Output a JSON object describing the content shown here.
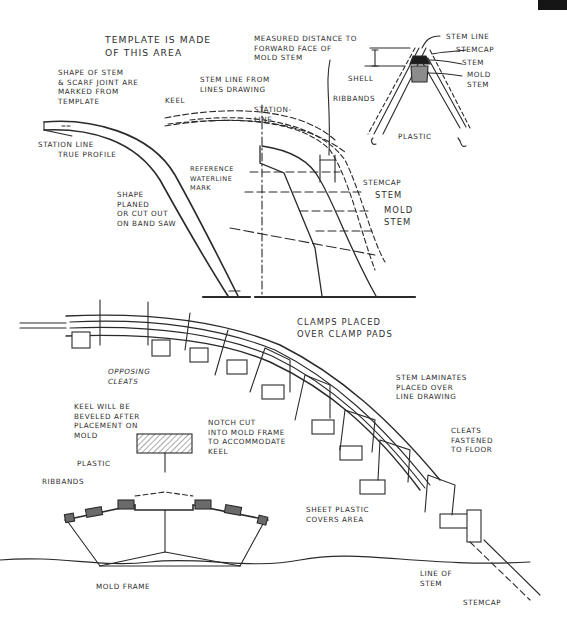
{
  "page_tab": {
    "color": "#151515"
  },
  "top_left": {
    "template_area": "TEMPLATE IS MADE\nOF THIS AREA",
    "shape_marked": "SHAPE OF STEM\n& SCARF JOINT ARE\nMARKED FROM\nTEMPLATE",
    "station_line": "STATION LINE",
    "true_profile": "TRUE PROFILE",
    "keel": "KEEL",
    "stem_line_from": "STEM LINE FROM\nLINES DRAWING",
    "shape_planed": "SHAPE\nPLANED\nOR CUT OUT\nON BAND SAW",
    "reference_waterline": "REFERENCE\nWATERLINE\nMARK"
  },
  "top_middle": {
    "measured_distance": "MEASURED DISTANCE TO\nFORWARD FACE OF\nMOLD STEM",
    "station_line": "STATION-\nLINE",
    "stemcap": "STEMCAP",
    "stem": "STEM",
    "mold_stem": "MOLD\nSTEM"
  },
  "top_right": {
    "stem_line": "STEM LINE",
    "stemcap": "STEMCAP",
    "stem": "STEM",
    "mold_stem": "MOLD\nSTEM",
    "shell": "SHELL",
    "ribbands": "RIBBANDS",
    "plastic": "PLASTIC"
  },
  "bottom": {
    "clamps": "CLAMPS PLACED\nOVER CLAMP PADS",
    "opposing_cleats": "OPPOSING\nCLEATS",
    "stem_laminates": "STEM LAMINATES\nPLACED OVER\nLINE DRAWING",
    "keel_beveled": "KEEL WILL BE\nBEVELED AFTER\nPLACEMENT ON\nMOLD",
    "notch_cut": "NOTCH CUT\nINTO MOLD FRAME\nTO ACCOMMODATE\nKEEL",
    "cleats_fastened": "CLEATS\nFASTENED\nTO FLOOR",
    "plastic": "PLASTIC",
    "ribbands": "RIBBANDS",
    "sheet_plastic": "SHEET PLASTIC\nCOVERS AREA",
    "mold_frame": "MOLD FRAME",
    "line_of_stem": "LINE OF\nSTEM",
    "stemcap": "STEMCAP"
  }
}
